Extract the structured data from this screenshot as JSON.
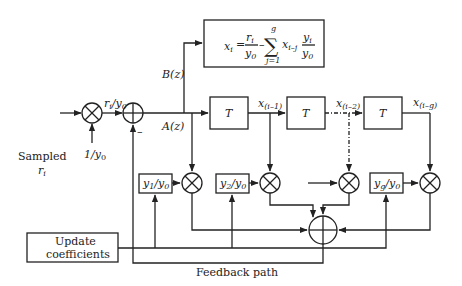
{
  "diagram": {
    "input_label_line1": "Sampled",
    "input_label_line2": "r",
    "input_label_sub": "i",
    "scale_input": "1/y",
    "scale_input_sub": "0",
    "normalized_signal": "r",
    "normalized_signal_sub1": "i",
    "normalized_signal_mid": "/y",
    "normalized_signal_sub2": "0",
    "minus_sign": "–",
    "branch_b": "B(z)",
    "branch_a": "A(z)",
    "formula": {
      "lhs": "x",
      "lhs_sub": "i",
      "eq": "=",
      "frac1_num": "r",
      "frac1_num_sub": "i",
      "frac1_den": "y",
      "frac1_den_sub": "0",
      "minus": "–",
      "sigma": "∑",
      "sigma_top": "g",
      "sigma_bottom": "j=1",
      "term": "x",
      "term_sub": "i–j",
      "frac2_num": "y",
      "frac2_num_sub": "i",
      "frac2_den": "y",
      "frac2_den_sub": "0"
    },
    "delay_blocks": [
      "T",
      "T",
      "T"
    ],
    "delay_outputs": [
      {
        "base": "x",
        "sub": "(i–1)"
      },
      {
        "base": "x",
        "sub": "(i–2)"
      },
      {
        "base": "x",
        "sub": "(i–g)"
      }
    ],
    "coefficients": [
      {
        "num": "y",
        "num_sub": "1",
        "den": "/y",
        "den_sub": "0"
      },
      {
        "num": "y",
        "num_sub": "2",
        "den": "/y",
        "den_sub": "0"
      },
      {
        "num": "y",
        "num_sub": "g",
        "den": "/y",
        "den_sub": "0"
      }
    ],
    "update_block_line1": "Update",
    "update_block_line2": "coefficients",
    "feedback_label": "Feedback path"
  }
}
